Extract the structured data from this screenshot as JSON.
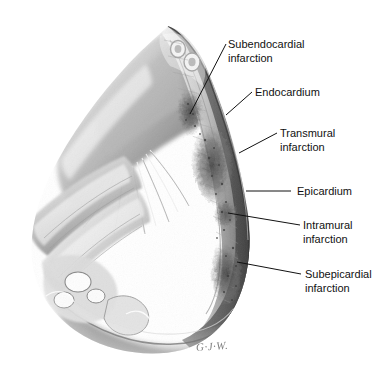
{
  "figure": {
    "background_color": "#ffffff",
    "ink_color": "#111111",
    "signature": "G·J·W."
  },
  "labels": [
    {
      "id": "subendocardial",
      "line1": "Subendocardial",
      "line2": "infarction",
      "text_x": 228,
      "text_y": 38,
      "leader": {
        "x1": 226,
        "y1": 44,
        "x2": 190,
        "y2": 114
      }
    },
    {
      "id": "endocardium",
      "line1": "Endocardium",
      "line2": "",
      "text_x": 255,
      "text_y": 86,
      "leader": {
        "x1": 252,
        "y1": 92,
        "x2": 226,
        "y2": 115
      }
    },
    {
      "id": "transmural",
      "line1": "Transmural",
      "line2": "infarction",
      "text_x": 280,
      "text_y": 127,
      "leader": {
        "x1": 277,
        "y1": 133,
        "x2": 239,
        "y2": 153
      }
    },
    {
      "id": "epicardium",
      "line1": "Epicardium",
      "line2": "",
      "text_x": 297,
      "text_y": 185,
      "leader": {
        "x1": 291,
        "y1": 191,
        "x2": 246,
        "y2": 191
      }
    },
    {
      "id": "intramural",
      "line1": "Intramural",
      "line2": "infarction",
      "text_x": 303,
      "text_y": 219,
      "leader": {
        "x1": 300,
        "y1": 225,
        "x2": 228,
        "y2": 213
      }
    },
    {
      "id": "subepicardial",
      "line1": "Subepicardial",
      "line2": "infarction",
      "text_x": 305,
      "text_y": 268,
      "leader": {
        "x1": 301,
        "y1": 274,
        "x2": 237,
        "y2": 262
      }
    }
  ]
}
